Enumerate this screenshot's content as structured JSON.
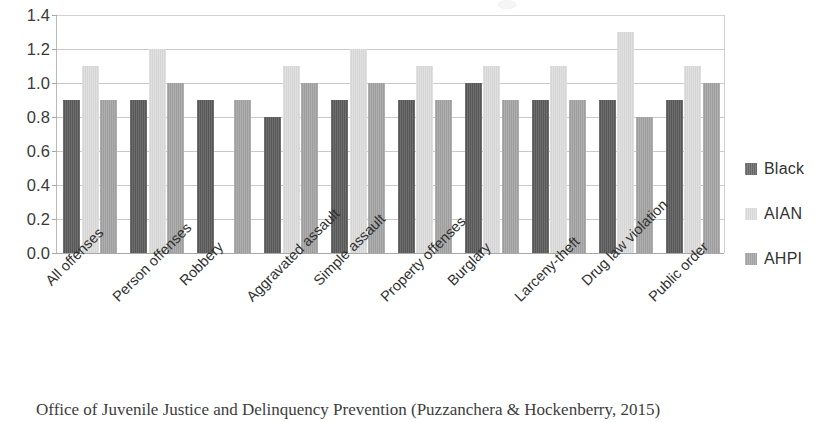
{
  "chart_data": {
    "type": "bar",
    "title": "",
    "subtitle": "",
    "xlabel": "",
    "ylabel": "",
    "ylim": [
      0.0,
      1.4
    ],
    "ystep": 0.2,
    "grid": true,
    "legend_position": "right",
    "ytick_labels": [
      "1.4",
      "1.2",
      "1.0",
      "0.8",
      "0.6",
      "0.4",
      "0.2",
      "0.0"
    ],
    "ytick_values": [
      1.4,
      1.2,
      1.0,
      0.8,
      0.6,
      0.4,
      0.2,
      0.0
    ],
    "categories": [
      "All offenses",
      "Person offenses",
      "Robbery",
      "Aggravated assault",
      "Simple assault",
      "Property offenses",
      "Burglary",
      "Larceny-theft",
      "Drug law violation",
      "Public order"
    ],
    "series": [
      {
        "name": "Black",
        "color": "#5a5a5a",
        "values": [
          0.9,
          0.9,
          0.9,
          0.8,
          0.9,
          0.9,
          1.0,
          0.9,
          0.9,
          0.9
        ]
      },
      {
        "name": "AIAN",
        "color": "#dcdcdc",
        "values": [
          1.1,
          1.2,
          0.0,
          1.1,
          1.2,
          1.1,
          1.1,
          1.1,
          1.3,
          1.1
        ]
      },
      {
        "name": "AHPI",
        "color": "#a3a3a3",
        "values": [
          0.9,
          1.0,
          0.9,
          1.0,
          1.0,
          0.9,
          0.9,
          0.9,
          0.8,
          1.0
        ]
      }
    ]
  },
  "legend": {
    "items": [
      {
        "label": "Black"
      },
      {
        "label": "AIAN"
      },
      {
        "label": "AHPI"
      }
    ]
  },
  "caption": {
    "text": "Office of Juvenile Justice and Delinquency Prevention (Puzzanchera & Hockenberry, 2015)"
  }
}
